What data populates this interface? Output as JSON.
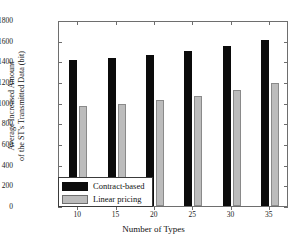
{
  "chart_data": {
    "type": "bar",
    "title": "",
    "xlabel": "Number of Types",
    "ylabel": "Average Increased Amount of the ST's Transmitted Data (bit)",
    "ylabel_lines": [
      "Average Increased Amount",
      "of the ST's Transmitted Data (bit)"
    ],
    "categories": [
      "10",
      "15",
      "20",
      "25",
      "30",
      "35"
    ],
    "series": [
      {
        "name": "Contract-based",
        "color": "#0b0b0b",
        "values": [
          1410,
          1435,
          1465,
          1500,
          1545,
          1610
        ]
      },
      {
        "name": "Linear pricing",
        "color": "#bcbcbc",
        "values": [
          965,
          990,
          1025,
          1065,
          1120,
          1195
        ]
      }
    ],
    "ylim": [
      0,
      1800
    ],
    "yticks": [
      "0",
      "200",
      "400",
      "600",
      "800",
      "1000",
      "1200",
      "1400",
      "1600",
      "1800"
    ],
    "ytick_values": [
      0,
      200,
      400,
      600,
      800,
      1000,
      1200,
      1400,
      1600,
      1800
    ],
    "grid": false,
    "legend_position": "lower-left",
    "axis_color": "#6e6e6e"
  }
}
